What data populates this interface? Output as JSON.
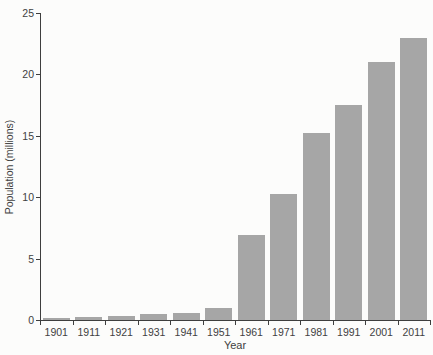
{
  "chart_data": {
    "type": "bar",
    "title": "",
    "xlabel": "Year",
    "ylabel": "Population (millions)",
    "categories": [
      "1901",
      "1911",
      "1921",
      "1931",
      "1941",
      "1951",
      "1961",
      "1971",
      "1981",
      "1991",
      "2001",
      "2011"
    ],
    "values": [
      0.2,
      0.25,
      0.35,
      0.45,
      0.6,
      1.0,
      6.9,
      10.3,
      15.2,
      17.5,
      21.0,
      23.0
    ],
    "ylim": [
      0,
      25
    ],
    "yticks": [
      0,
      5,
      10,
      15,
      20,
      25
    ],
    "grid": false,
    "legend": false,
    "colors": {
      "bar": "#a6a6a6",
      "axis": "#3e3e3e",
      "text": "#414141",
      "background": "#fcfcfb"
    }
  }
}
